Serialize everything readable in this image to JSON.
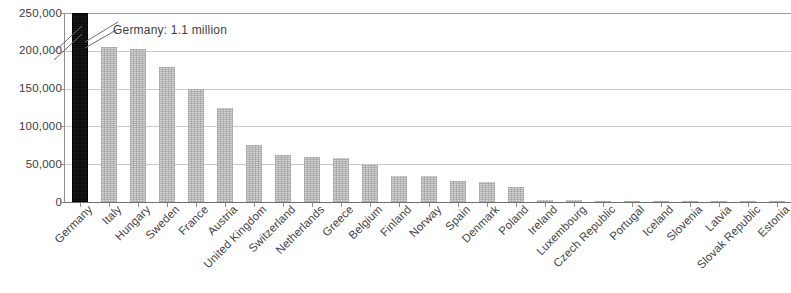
{
  "chart_data": {
    "type": "bar",
    "title": "",
    "subtitle": "",
    "xlabel": "",
    "ylabel": "",
    "ylim": [
      0,
      250000
    ],
    "grid": true,
    "legend": false,
    "axis_break": true,
    "axis_break_note": "Germany bar is truncated; its true value exceeds the 250,000 axis maximum",
    "ytick_labels": [
      "250,000",
      "200,000",
      "150,000",
      "100,000",
      "50,000",
      "0"
    ],
    "ytick_values": [
      250000,
      200000,
      150000,
      100000,
      50000,
      0
    ],
    "categories": [
      "Germany",
      "Italy",
      "Hungary",
      "Sweden",
      "France",
      "Austria",
      "United Kingdom",
      "Switzerland",
      "Netherlands",
      "Greece",
      "Belgium",
      "Finland",
      "Norway",
      "Spain",
      "Denmark",
      "Poland",
      "Ireland",
      "Luxembourg",
      "Czech Republic",
      "Portugal",
      "Iceland",
      "Slovenia",
      "Latvia",
      "Slovak Republic",
      "Estonia"
    ],
    "values": [
      1100000,
      205000,
      203000,
      178000,
      150000,
      124000,
      76000,
      62000,
      60000,
      58000,
      50000,
      35000,
      34000,
      28000,
      26000,
      20000,
      3000,
      2500,
      1200,
      800,
      600,
      500,
      400,
      300,
      200
    ],
    "displayed_bar_values": [
      250000,
      205000,
      203000,
      178000,
      150000,
      124000,
      76000,
      62000,
      60000,
      58000,
      50000,
      35000,
      34000,
      28000,
      26000,
      20000,
      3000,
      2500,
      1200,
      800,
      600,
      500,
      400,
      300,
      200
    ],
    "highlight_index": 0,
    "annotations": [
      {
        "name": "germany-callout",
        "text": "Germany: 1.1 million",
        "target_category": "Germany"
      }
    ],
    "colors": {
      "bar": "#d2d2d2",
      "bar_highlight": "#0b0b0b",
      "gridline": "#c9c9c9",
      "axis": "#8d8d8d",
      "text": "#3d3d3d"
    }
  }
}
